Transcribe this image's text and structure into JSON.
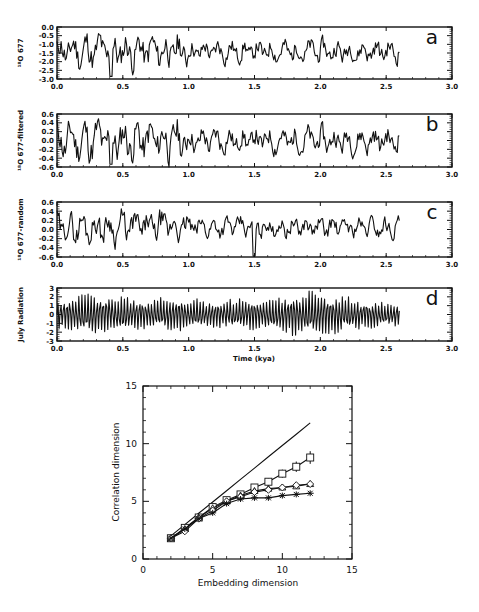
{
  "chart_data": [
    {
      "id": "a",
      "type": "line",
      "panel_letter": "a",
      "ylabel": "¹⁸O 677",
      "xlabel": "",
      "xlim": [
        0.0,
        3.0
      ],
      "ylim": [
        -3.0,
        0.0
      ],
      "x_ticks": [
        "0.0",
        "0.5",
        "1.0",
        "1.5",
        "2.0",
        "2.5",
        "3.0"
      ],
      "y_ticks": [
        "0.0",
        "-0.5",
        "-1.0",
        "-1.5",
        "-2.0",
        "-2.5",
        "-3.0"
      ],
      "series": [
        {
          "name": "¹⁸O 677",
          "x_range": [
            0.0,
            2.6
          ],
          "mean": -1.4,
          "amplitude": 0.55,
          "seed": 11,
          "description": "noisy record, larger swings before 1.0 Ma"
        }
      ]
    },
    {
      "id": "b",
      "type": "line",
      "panel_letter": "b",
      "ylabel": "¹⁸O 677-filtered",
      "xlabel": "",
      "xlim": [
        0.0,
        3.0
      ],
      "ylim": [
        -0.6,
        0.6
      ],
      "x_ticks": [
        "0.0",
        "0.5",
        "1.0",
        "1.5",
        "2.0",
        "2.5",
        "3.0"
      ],
      "y_ticks": [
        "0.6",
        "0.4",
        "0.2",
        "0.0",
        "-0.2",
        "-0.4",
        "-0.6"
      ],
      "series": [
        {
          "name": "¹⁸O 677-filtered",
          "x_range": [
            0.0,
            2.6
          ],
          "mean": 0.0,
          "amplitude": 0.25,
          "seed": 11,
          "description": "filtered record"
        }
      ]
    },
    {
      "id": "c",
      "type": "line",
      "panel_letter": "c",
      "ylabel": "¹⁸O 677-random",
      "xlabel": "",
      "xlim": [
        0.0,
        3.0
      ],
      "ylim": [
        -0.6,
        0.6
      ],
      "x_ticks": [
        "0.0",
        "0.5",
        "1.0",
        "1.5",
        "2.0",
        "2.5",
        "3.0"
      ],
      "y_ticks": [
        "0.6",
        "0.4",
        "0.2",
        "0.0",
        "-0.2",
        "-0.4",
        "-0.6"
      ],
      "series": [
        {
          "name": "¹⁸O 677-random",
          "x_range": [
            0.0,
            2.6
          ],
          "mean": 0.05,
          "amplitude": 0.18,
          "seed": 29,
          "description": "random residual; dip to -0.6 near 1.5"
        }
      ]
    },
    {
      "id": "d",
      "type": "line",
      "panel_letter": "d",
      "ylabel": "July Radiation",
      "xlabel": "Time (kya)",
      "xlim": [
        0.0,
        3.0
      ],
      "ylim": [
        -3,
        3
      ],
      "x_ticks": [
        "0.0",
        "0.5",
        "1.0",
        "1.5",
        "2.0",
        "2.5",
        "3.0"
      ],
      "y_ticks": [
        "3",
        "2",
        "1",
        "0",
        "-1",
        "-2",
        "-3"
      ],
      "series": [
        {
          "name": "July Radiation",
          "x_range": [
            0.0,
            2.6
          ],
          "mean": 0,
          "amplitude": 2.2,
          "seed": 5,
          "description": "quasi-periodic insolation oscillation"
        }
      ]
    },
    {
      "id": "correlation",
      "type": "line",
      "title": "",
      "xlabel": "Embedding dimension",
      "ylabel": "Correlation dimension",
      "xlim": [
        0,
        15
      ],
      "ylim": [
        0,
        15
      ],
      "x_ticks": [
        "0",
        "5",
        "10",
        "15"
      ],
      "y_ticks": [
        "0",
        "5",
        "10",
        "15"
      ],
      "x": [
        2,
        3,
        4,
        5,
        6,
        7,
        8,
        9,
        10,
        11,
        12
      ],
      "series": [
        {
          "name": "reference line",
          "marker": "none",
          "values": [
            2.0,
            2.98,
            3.96,
            4.94,
            5.92,
            6.9,
            7.88,
            8.86,
            9.84,
            10.82,
            11.8
          ]
        },
        {
          "name": "squares",
          "marker": "square",
          "values": [
            1.8,
            2.7,
            3.6,
            4.5,
            5.1,
            5.6,
            6.2,
            6.7,
            7.4,
            8.0,
            8.8
          ],
          "error": [
            0.1,
            0.1,
            0.1,
            0.15,
            0.2,
            0.2,
            0.25,
            0.3,
            0.35,
            0.45,
            0.55
          ]
        },
        {
          "name": "triangles",
          "marker": "triangle",
          "values": [
            1.8,
            2.6,
            3.6,
            4.4,
            5.0,
            5.5,
            5.9,
            6.1,
            6.2,
            6.3,
            6.5
          ]
        },
        {
          "name": "diamonds",
          "marker": "diamond",
          "values": [
            1.8,
            2.4,
            3.5,
            4.2,
            5.0,
            5.4,
            5.8,
            6.0,
            6.2,
            6.4,
            6.5
          ]
        },
        {
          "name": "asterisks",
          "marker": "asterisk",
          "values": [
            1.8,
            2.6,
            3.5,
            4.0,
            4.8,
            5.2,
            5.3,
            5.3,
            5.5,
            5.6,
            5.7
          ]
        }
      ]
    }
  ],
  "colors": {
    "ink": "#111111",
    "background": "#ffffff"
  }
}
